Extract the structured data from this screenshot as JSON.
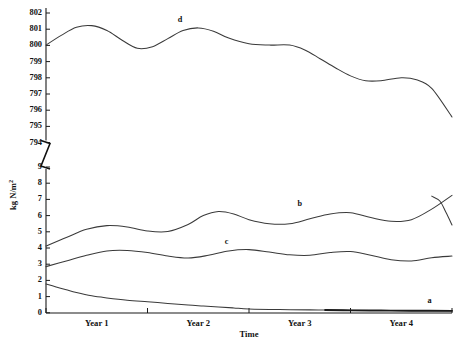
{
  "chart_data": {
    "type": "line",
    "title": "",
    "xlabel": "Time",
    "ylabel": "kg N/m",
    "ylabel_superscript": "2",
    "ylabel_full": "kg N/m2",
    "grid": false,
    "legend_position": "inline-curve-labels",
    "axis_break": {
      "present": true,
      "between": [
        794,
        9
      ],
      "symbol": "zigzag"
    },
    "y_axis_upper": {
      "ticks": [
        794,
        795,
        796,
        797,
        798,
        799,
        800,
        801,
        802
      ],
      "ylim": [
        794,
        802.3
      ]
    },
    "y_axis_lower": {
      "ticks": [
        0,
        1,
        2,
        3,
        4,
        5,
        6,
        7,
        8,
        9
      ],
      "ylim": [
        0,
        9.2
      ]
    },
    "x_tick_labels": [
      "Year 1",
      "Year 2",
      "Year 3",
      "Year 4"
    ],
    "x_tick_label_positions": [
      0.5,
      1.5,
      2.5,
      3.5
    ],
    "x_minor_ticks": [
      0,
      1,
      2,
      3,
      4
    ],
    "xlim": [
      0,
      4
    ],
    "series": [
      {
        "name": "a",
        "label": "a",
        "scale": "lower",
        "label_x": 3.78,
        "label_y": 0.62,
        "style": "thin-then-thick",
        "x": [
          0.0,
          0.1,
          0.2,
          0.3,
          0.45,
          0.6,
          0.8,
          1.0,
          1.2,
          1.4,
          1.55,
          1.7,
          1.85,
          2.0,
          2.3,
          2.6,
          2.75,
          3.0,
          3.3,
          3.6,
          4.0
        ],
        "values": [
          1.78,
          1.6,
          1.42,
          1.25,
          1.05,
          0.92,
          0.78,
          0.68,
          0.58,
          0.48,
          0.42,
          0.36,
          0.3,
          0.24,
          0.2,
          0.18,
          0.17,
          0.15,
          0.14,
          0.13,
          0.12
        ]
      },
      {
        "name": "c",
        "label": "c",
        "scale": "lower",
        "label_x": 1.78,
        "label_y": 4.25,
        "style": "thin",
        "x": [
          0.0,
          0.2,
          0.4,
          0.6,
          0.8,
          1.0,
          1.2,
          1.4,
          1.6,
          1.8,
          2.0,
          2.2,
          2.4,
          2.6,
          2.8,
          3.0,
          3.2,
          3.4,
          3.6,
          3.8,
          4.0
        ],
        "values": [
          2.85,
          3.2,
          3.55,
          3.82,
          3.85,
          3.72,
          3.5,
          3.38,
          3.55,
          3.82,
          3.9,
          3.75,
          3.58,
          3.55,
          3.72,
          3.78,
          3.55,
          3.28,
          3.2,
          3.4,
          3.5
        ]
      },
      {
        "name": "b",
        "label": "b",
        "scale": "lower",
        "label_x": 2.5,
        "label_y": 6.62,
        "style": "thin",
        "x": [
          0.0,
          0.2,
          0.4,
          0.6,
          0.8,
          1.0,
          1.2,
          1.4,
          1.55,
          1.7,
          1.85,
          2.0,
          2.2,
          2.4,
          2.6,
          2.8,
          3.0,
          3.2,
          3.4,
          3.6,
          3.8,
          4.0
        ],
        "values": [
          4.12,
          4.65,
          5.15,
          5.38,
          5.3,
          5.05,
          5.02,
          5.45,
          6.0,
          6.25,
          6.1,
          5.75,
          5.5,
          5.5,
          5.8,
          6.1,
          6.18,
          5.88,
          5.65,
          5.75,
          6.4,
          7.25
        ]
      },
      {
        "name": "b_tail",
        "label": "",
        "scale": "lower",
        "style": "thin",
        "x": [
          3.8,
          3.88,
          3.94,
          4.0
        ],
        "values": [
          7.2,
          6.9,
          6.2,
          5.42
        ]
      },
      {
        "name": "d",
        "label": "d",
        "scale": "upper",
        "label_x": 1.32,
        "label_y": 801.42,
        "style": "thin",
        "x": [
          0.0,
          0.15,
          0.3,
          0.45,
          0.6,
          0.75,
          0.9,
          1.05,
          1.2,
          1.35,
          1.5,
          1.65,
          1.8,
          2.0,
          2.2,
          2.4,
          2.55,
          2.7,
          2.85,
          3.0,
          3.15,
          3.3,
          3.5,
          3.65,
          3.8,
          4.0
        ],
        "values": [
          800.02,
          800.62,
          801.12,
          801.22,
          800.92,
          800.32,
          799.82,
          799.92,
          800.42,
          800.92,
          801.08,
          800.88,
          800.45,
          800.1,
          800.02,
          800.02,
          799.72,
          799.18,
          798.62,
          798.12,
          797.82,
          797.82,
          798.0,
          797.88,
          797.35,
          795.58
        ]
      }
    ]
  },
  "accessibility": {
    "description": "Line chart with broken y-axis showing four curves labeled a, b, c, d over four years"
  }
}
